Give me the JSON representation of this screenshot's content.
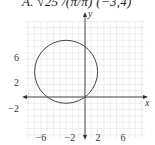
{
  "header": {
    "text": "A.   √25 /(π/π)   (−3,4)"
  },
  "chart_data": {
    "type": "line",
    "title": "",
    "xlabel": "x",
    "ylabel": "y",
    "xlim": [
      -9.5,
      9.5
    ],
    "ylim": [
      -4.5,
      11.5
    ],
    "grid": true,
    "x_ticks": [
      -6,
      -2,
      2,
      6
    ],
    "y_ticks": [
      -2,
      2,
      6
    ],
    "series": [
      {
        "name": "circle",
        "shape": "circle",
        "center": [
          -3,
          4
        ],
        "radius": 5
      }
    ]
  },
  "labels": {
    "x_axis": "x",
    "y_axis": "y",
    "xt0": "−6",
    "xt1": "−2",
    "xt2": "2",
    "xt3": "6",
    "yt0": "6",
    "yt1": "2",
    "yt2": "−2"
  },
  "colors": {
    "grid": "#e2e2e2",
    "axis": "#333333",
    "curve": "#444444"
  }
}
